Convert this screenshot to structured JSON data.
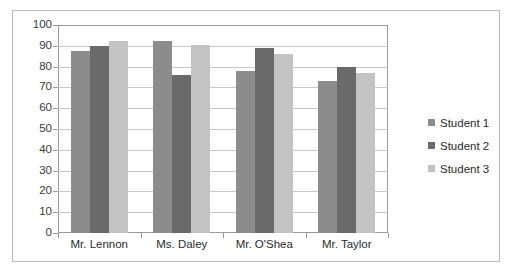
{
  "chart_data": {
    "type": "bar",
    "title": "",
    "xlabel": "",
    "ylabel": "",
    "categories": [
      "Mr. Lennon",
      "Ms. Daley",
      "Mr. O'Shea",
      "Mr. Taylor"
    ],
    "series": [
      {
        "name": "Student 1",
        "color": "#8c8c8c",
        "values": [
          87.5,
          92.5,
          78,
          73
        ]
      },
      {
        "name": "Student 2",
        "color": "#6a6a6a",
        "values": [
          90,
          76,
          89,
          80
        ]
      },
      {
        "name": "Student 3",
        "color": "#c3c3c3",
        "values": [
          92.5,
          90.5,
          86,
          77
        ]
      }
    ],
    "ylim": [
      0,
      100
    ],
    "ytick_step": 10,
    "ytick_labels": [
      "100",
      "90",
      "80",
      "70",
      "60",
      "50",
      "40",
      "30",
      "20",
      "10",
      "0"
    ],
    "grid": true,
    "legend_position": "right",
    "legend_entries": [
      "Student 1",
      "Student 2",
      "Student 3"
    ],
    "plot_background": "#ffffff",
    "grid_color": "#c9c9c9",
    "axis_color": "#9a9a9a",
    "frame_border_color": "#b9b9b9"
  }
}
